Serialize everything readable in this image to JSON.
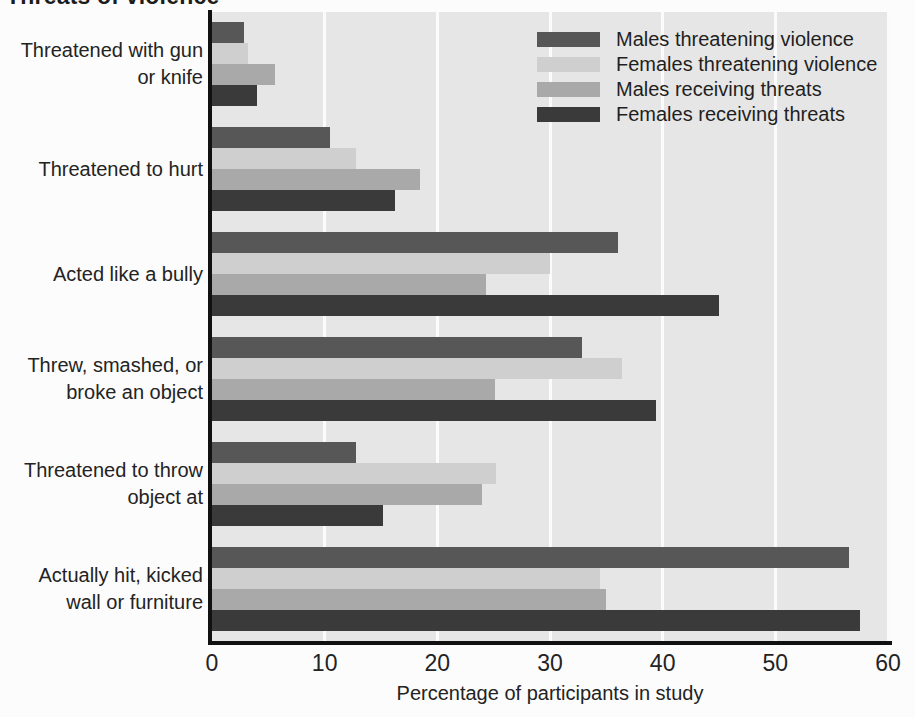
{
  "title": "Threats of violence",
  "legend": {
    "position": "top-right",
    "entries": [
      {
        "label": "Males threatening violence",
        "color": "#575757",
        "swatch": "legend-swatch-males-threatening"
      },
      {
        "label": "Females threatening violence",
        "color": "#cfcfcf",
        "swatch": "legend-swatch-females-threatening"
      },
      {
        "label": "Males receiving threats",
        "color": "#a9a9a9",
        "swatch": "legend-swatch-males-receiving"
      },
      {
        "label": "Females receiving threats",
        "color": "#3a3a3a",
        "swatch": "legend-swatch-females-receiving"
      }
    ]
  },
  "axis": {
    "x_title": "Percentage of participants in study",
    "x_ticks": [
      "0",
      "10",
      "20",
      "30",
      "40",
      "50",
      "60"
    ]
  },
  "chart_data": {
    "type": "bar",
    "orientation": "horizontal",
    "title": "Threats of violence",
    "xlabel": "Percentage of participants in study",
    "ylabel": "",
    "xlim": [
      0,
      60
    ],
    "xticks": [
      0,
      10,
      20,
      30,
      40,
      50,
      60
    ],
    "grid": true,
    "grid_axis": "x",
    "legend_position": "top-right",
    "categories": [
      "Threatened with gun or knife",
      "Threatened to hurt",
      "Acted like a bully",
      "Threw, smashed, or broke an object",
      "Threatened to throw object at",
      "Actually hit, kicked wall or furniture"
    ],
    "category_lines": [
      [
        "Threatened with gun",
        "or knife"
      ],
      [
        "Threatened to hurt"
      ],
      [
        "Acted like a bully"
      ],
      [
        "Threw, smashed, or",
        "broke an object"
      ],
      [
        "Threatened to throw",
        "object at"
      ],
      [
        "Actually hit, kicked",
        "wall or furniture"
      ]
    ],
    "series": [
      {
        "name": "Males threatening violence",
        "color": "#575757",
        "values": [
          2.8,
          10.5,
          36.0,
          32.8,
          12.8,
          56.5
        ]
      },
      {
        "name": "Females threatening violence",
        "color": "#cfcfcf",
        "values": [
          3.2,
          12.8,
          30.0,
          36.4,
          25.2,
          34.4
        ]
      },
      {
        "name": "Males receiving threats",
        "color": "#a9a9a9",
        "values": [
          5.6,
          18.5,
          24.3,
          25.1,
          24.0,
          35.0
        ]
      },
      {
        "name": "Females receiving threats",
        "color": "#3a3a3a",
        "values": [
          4.0,
          16.2,
          45.0,
          39.4,
          15.2,
          57.5
        ]
      }
    ]
  }
}
